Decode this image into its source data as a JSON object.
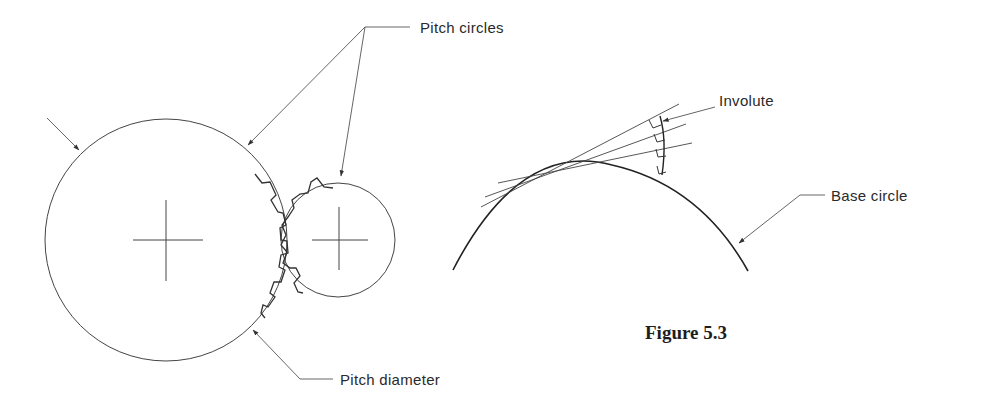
{
  "figure": {
    "caption": "Figure 5.3",
    "left_diagram": {
      "subject": "meshing gears",
      "labels": {
        "pitch_circles": "Pitch circles",
        "pitch_diameter": "Pitch diameter"
      }
    },
    "right_diagram": {
      "subject": "involute curve generation",
      "labels": {
        "involute": "Involute",
        "base_circle": "Base circle"
      }
    }
  },
  "colors": {
    "line": "#3a3a3a",
    "text": "#2a2a2a",
    "background": "#ffffff"
  }
}
